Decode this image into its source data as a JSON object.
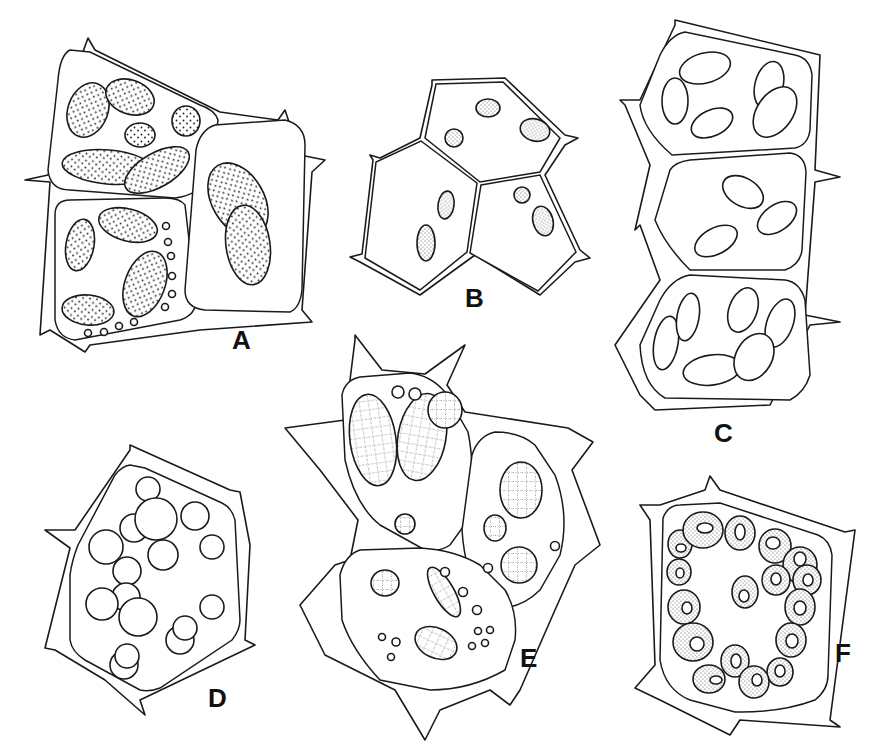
{
  "figure": {
    "type": "botanical line drawing — plant cells with plastids",
    "panels": [
      {
        "id": "A",
        "label": "A",
        "description": "Three cells with densely stippled elongated plastids; small vesicles along wall"
      },
      {
        "id": "B",
        "label": "B",
        "description": "Four polygonal cells with small compound granular plastids"
      },
      {
        "id": "C",
        "label": "C",
        "description": "Column of three cells with smooth oval plastids bearing dotted margins"
      },
      {
        "id": "D",
        "label": "D",
        "description": "Single hexagonal cell with round simple and compound grains"
      },
      {
        "id": "E",
        "label": "E",
        "description": "Three cells with large reticulate compound plastids and small vesicles"
      },
      {
        "id": "F",
        "label": "F",
        "description": "Single cell with ring of stippled plastids each containing a central clear body"
      }
    ]
  },
  "colors": {
    "background": "#ffffff",
    "ink": "#1a1a1a"
  }
}
